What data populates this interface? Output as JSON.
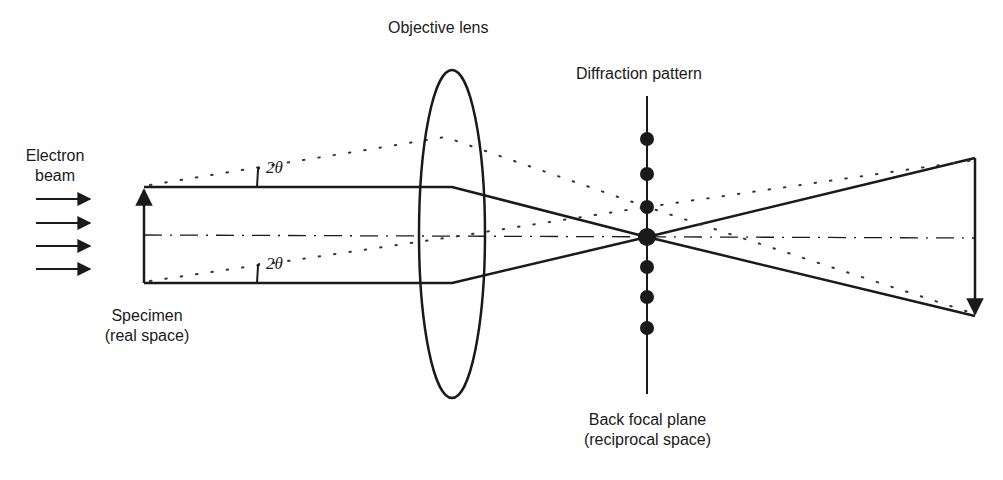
{
  "diagram": {
    "labels": {
      "objective_lens": "Objective lens",
      "diffraction_pattern": "Diffraction pattern",
      "electron_beam_line1": "Electron",
      "electron_beam_line2": "beam",
      "specimen_line1": "Specimen",
      "specimen_line2": "(real space)",
      "back_focal_plane_line1": "Back focal plane",
      "back_focal_plane_line2": "(reciprocal space)",
      "angle_top": "2θ",
      "angle_bottom": "2θ"
    },
    "incident_arrows_count": 4,
    "diffraction_spots_count": 7,
    "colors": {
      "ink": "#1a1a1a",
      "background": "#ffffff"
    }
  }
}
